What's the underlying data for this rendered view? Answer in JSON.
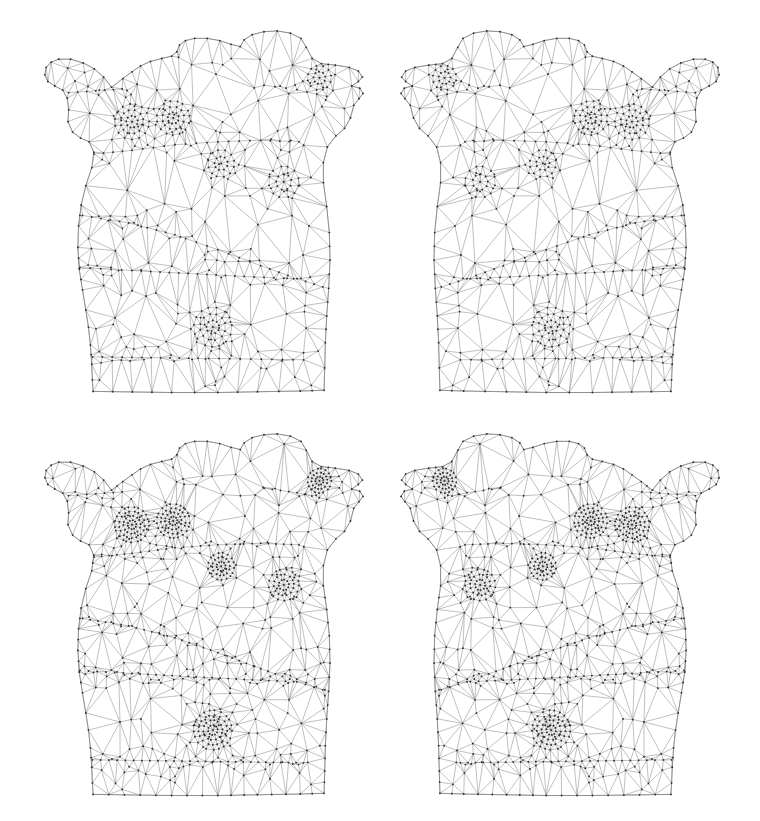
{
  "figure": {
    "type": "mesh-grid",
    "title": "",
    "background_color": "#ffffff",
    "width": 760,
    "height": 821,
    "rows": 2,
    "columns": 4,
    "panel_count": 4,
    "render_style": "wireframe",
    "edge_color": "#8c8c8c",
    "outline_color": "#7a7a7a",
    "vertex_color": "#2b2b2b",
    "edge_width": 0.55,
    "outline_width": 0.7,
    "vertex_radius": 0.9
  },
  "panels": [
    {
      "id": "panel-top-left",
      "name": "top-left-mesh",
      "caption": "",
      "position": {
        "left": 33,
        "top": 22,
        "width": 330,
        "height": 372
      },
      "mirrored": false,
      "seed": 20117,
      "density": 1.0,
      "refine_passes": 1
    },
    {
      "id": "panel-top-right",
      "name": "top-right-mesh",
      "caption": "",
      "position": {
        "left": 401,
        "top": 22,
        "width": 330,
        "height": 372
      },
      "mirrored": true,
      "seed": 20117,
      "density": 1.0,
      "refine_passes": 1
    },
    {
      "id": "panel-bottom-left",
      "name": "bottom-left-mesh",
      "caption": "",
      "position": {
        "left": 33,
        "top": 425,
        "width": 330,
        "height": 372
      },
      "mirrored": false,
      "seed": 20117,
      "density": 1.26,
      "refine_passes": 2
    },
    {
      "id": "panel-bottom-right",
      "name": "bottom-right-mesh",
      "caption": "",
      "position": {
        "left": 401,
        "top": 425,
        "width": 330,
        "height": 372
      },
      "mirrored": true,
      "seed": 20117,
      "density": 1.26,
      "refine_passes": 2
    }
  ],
  "chart_data": {
    "type": "mesh",
    "xlabel": "",
    "ylabel": "",
    "legend": [],
    "grid": false,
    "outline": [
      [
        0.238,
        0.175
      ],
      [
        0.214,
        0.148
      ],
      [
        0.186,
        0.126
      ],
      [
        0.152,
        0.11
      ],
      [
        0.114,
        0.1
      ],
      [
        0.078,
        0.1
      ],
      [
        0.055,
        0.108
      ],
      [
        0.04,
        0.122
      ],
      [
        0.036,
        0.142
      ],
      [
        0.045,
        0.16
      ],
      [
        0.066,
        0.172
      ],
      [
        0.09,
        0.183
      ],
      [
        0.104,
        0.205
      ],
      [
        0.108,
        0.236
      ],
      [
        0.106,
        0.268
      ],
      [
        0.12,
        0.296
      ],
      [
        0.144,
        0.312
      ],
      [
        0.17,
        0.322
      ],
      [
        0.184,
        0.35
      ],
      [
        0.178,
        0.392
      ],
      [
        0.16,
        0.44
      ],
      [
        0.146,
        0.492
      ],
      [
        0.138,
        0.548
      ],
      [
        0.136,
        0.606
      ],
      [
        0.14,
        0.664
      ],
      [
        0.15,
        0.72
      ],
      [
        0.16,
        0.774
      ],
      [
        0.168,
        0.82
      ],
      [
        0.174,
        0.868
      ],
      [
        0.178,
        0.92
      ],
      [
        0.18,
        0.962
      ],
      [
        0.182,
        0.993
      ],
      [
        0.42,
        0.996
      ],
      [
        0.56,
        0.996
      ],
      [
        0.68,
        0.994
      ],
      [
        0.81,
        0.992
      ],
      [
        0.882,
        0.99
      ],
      [
        0.884,
        0.93
      ],
      [
        0.886,
        0.862
      ],
      [
        0.89,
        0.79
      ],
      [
        0.896,
        0.716
      ],
      [
        0.9,
        0.64
      ],
      [
        0.898,
        0.566
      ],
      [
        0.89,
        0.496
      ],
      [
        0.88,
        0.432
      ],
      [
        0.88,
        0.378
      ],
      [
        0.892,
        0.336
      ],
      [
        0.918,
        0.306
      ],
      [
        0.944,
        0.286
      ],
      [
        0.962,
        0.258
      ],
      [
        0.972,
        0.224
      ],
      [
        0.988,
        0.206
      ],
      [
        1.0,
        0.192
      ],
      [
        0.99,
        0.178
      ],
      [
        0.966,
        0.172
      ],
      [
        0.986,
        0.16
      ],
      [
        0.998,
        0.148
      ],
      [
        0.986,
        0.132
      ],
      [
        0.958,
        0.122
      ],
      [
        0.916,
        0.116
      ],
      [
        0.874,
        0.112
      ],
      [
        0.846,
        0.098
      ],
      [
        0.828,
        0.068
      ],
      [
        0.812,
        0.044
      ],
      [
        0.78,
        0.03
      ],
      [
        0.74,
        0.024
      ],
      [
        0.7,
        0.026
      ],
      [
        0.664,
        0.034
      ],
      [
        0.64,
        0.048
      ],
      [
        0.628,
        0.066
      ],
      [
        0.6,
        0.06
      ],
      [
        0.566,
        0.05
      ],
      [
        0.528,
        0.044
      ],
      [
        0.49,
        0.044
      ],
      [
        0.462,
        0.05
      ],
      [
        0.444,
        0.062
      ],
      [
        0.436,
        0.08
      ],
      [
        0.42,
        0.092
      ],
      [
        0.39,
        0.098
      ],
      [
        0.356,
        0.106
      ],
      [
        0.326,
        0.118
      ],
      [
        0.3,
        0.134
      ],
      [
        0.272,
        0.152
      ]
    ],
    "refinement_regions": [
      {
        "name": "left-nipple",
        "cx": 0.3,
        "cy": 0.268,
        "r": 0.052,
        "level": 3
      },
      {
        "name": "right-nipple",
        "cx": 0.425,
        "cy": 0.258,
        "r": 0.05,
        "level": 3
      },
      {
        "name": "sternum-mark",
        "cx": 0.57,
        "cy": 0.38,
        "r": 0.04,
        "level": 2
      },
      {
        "name": "navel",
        "cx": 0.545,
        "cy": 0.82,
        "r": 0.058,
        "level": 3
      },
      {
        "name": "right-flank",
        "cx": 0.76,
        "cy": 0.43,
        "r": 0.046,
        "level": 2
      },
      {
        "name": "collar-notch",
        "cx": 0.868,
        "cy": 0.15,
        "r": 0.036,
        "level": 2
      }
    ],
    "feature_edges": [
      {
        "name": "upper-chest-band",
        "points": [
          [
            0.185,
            0.355
          ],
          [
            0.3,
            0.345
          ],
          [
            0.43,
            0.33
          ],
          [
            0.56,
            0.322
          ],
          [
            0.69,
            0.318
          ],
          [
            0.806,
            0.322
          ]
        ]
      },
      {
        "name": "rib-diagonal",
        "points": [
          [
            0.15,
            0.52
          ],
          [
            0.29,
            0.54
          ],
          [
            0.43,
            0.572
          ],
          [
            0.56,
            0.612
          ],
          [
            0.69,
            0.655
          ],
          [
            0.8,
            0.69
          ],
          [
            0.878,
            0.712
          ]
        ]
      },
      {
        "name": "waist-band",
        "points": [
          [
            0.142,
            0.66
          ],
          [
            0.3,
            0.668
          ],
          [
            0.47,
            0.676
          ],
          [
            0.64,
            0.684
          ],
          [
            0.79,
            0.69
          ]
        ]
      },
      {
        "name": "lower-band",
        "points": [
          [
            0.18,
            0.9
          ],
          [
            0.33,
            0.902
          ],
          [
            0.5,
            0.904
          ],
          [
            0.66,
            0.906
          ],
          [
            0.82,
            0.908
          ]
        ]
      },
      {
        "name": "shoulder-seam-l",
        "points": [
          [
            0.108,
            0.19
          ],
          [
            0.19,
            0.185
          ],
          [
            0.27,
            0.18
          ]
        ]
      },
      {
        "name": "shoulder-seam-r",
        "points": [
          [
            0.7,
            0.17
          ],
          [
            0.8,
            0.182
          ],
          [
            0.89,
            0.2
          ]
        ]
      }
    ],
    "counts": {
      "panel_top_left_vertices": 386,
      "panel_top_right_vertices": 386,
      "panel_bottom_left_vertices": 498,
      "panel_bottom_right_vertices": 498
    }
  }
}
